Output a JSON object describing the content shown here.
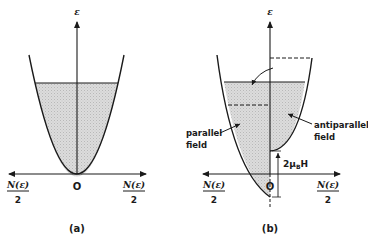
{
  "diagram": {
    "panels": [
      {
        "id": "a",
        "caption": "(a)",
        "axis_label_vertical": "ε",
        "origin_label": "O",
        "left_axis_label": {
          "numerator": "N(ε)",
          "denominator": "2"
        },
        "right_axis_label": {
          "numerator": "N(ε)",
          "denominator": "2"
        }
      },
      {
        "id": "b",
        "caption": "(b)",
        "axis_label_vertical": "ε",
        "origin_label": "O",
        "left_axis_label": {
          "numerator": "N(ε)",
          "denominator": "2"
        },
        "right_axis_label": {
          "numerator": "N(ε)",
          "denominator": "2"
        },
        "parallel_label_line1": "parallel",
        "parallel_label_line2": "field",
        "antiparallel_label_line1": "antiparallel",
        "antiparallel_label_line2": "field",
        "splitting_label_prefix": "2μ",
        "splitting_label_sub": "B",
        "splitting_label_suffix": "H"
      }
    ],
    "colors": {
      "line": "#1a1a1a",
      "fill": "#d4d4d4",
      "background": "#ffffff"
    }
  }
}
